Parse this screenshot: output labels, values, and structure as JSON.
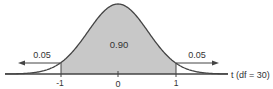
{
  "chart_data": {
    "type": "area",
    "title": "",
    "xlabel": "t (df = 30)",
    "ylabel": "",
    "df": 30,
    "x_ticks": [
      "-1",
      "0",
      "1"
    ],
    "regions": [
      {
        "name": "left-tail",
        "range": [
          "-inf",
          -1
        ],
        "area": 0.05,
        "shaded": false,
        "label": "0.05"
      },
      {
        "name": "center",
        "range": [
          -1,
          1
        ],
        "area": 0.9,
        "shaded": true,
        "label": "0.90"
      },
      {
        "name": "right-tail",
        "range": [
          1,
          "inf"
        ],
        "area": 0.05,
        "shaded": false,
        "label": "0.05"
      }
    ],
    "grid": false,
    "legend": null
  },
  "labels": {
    "left_tail": "0.05",
    "center": "0.90",
    "right_tail": "0.05",
    "axis": "t (df = 30)",
    "tick_neg1": "-1",
    "tick_0": "0",
    "tick_pos1": "1"
  },
  "colors": {
    "shade": "#c8c8c8",
    "curve": "#444444",
    "axis": "#444444",
    "text": "#333333"
  }
}
